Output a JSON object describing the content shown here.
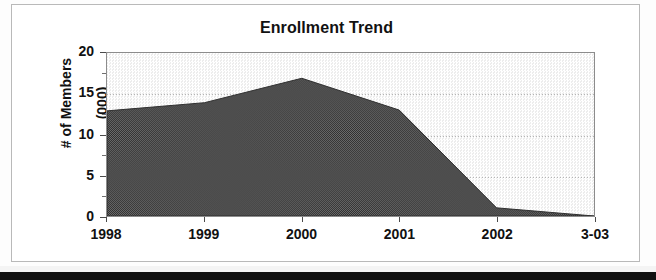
{
  "chart_data": {
    "type": "area",
    "title": "Enrollment Trend",
    "xlabel": "",
    "ylabel": "# of Members\n(000)",
    "ylabel_line1": "# of Members",
    "ylabel_line2": "(000)",
    "categories": [
      "1998",
      "1999",
      "2000",
      "2001",
      "2002",
      "3-03"
    ],
    "x": [
      "1998",
      "1999",
      "2000",
      "2001",
      "2002",
      "3-03"
    ],
    "values": [
      12.9,
      13.9,
      16.9,
      13.0,
      1.0,
      0.0
    ],
    "series": [
      {
        "name": "# of Members (000)",
        "values": [
          12.9,
          13.9,
          16.9,
          13.0,
          1.0,
          0.0
        ]
      }
    ],
    "ylim": [
      0,
      20
    ],
    "y_ticks": [
      "0",
      "5",
      "10",
      "15",
      "20"
    ],
    "y_tick_values": [
      0,
      5,
      10,
      15,
      20
    ],
    "y_minor_tick_values": [
      2.5,
      7.5,
      12.5,
      17.5
    ],
    "x_tick_labels": [
      "1998",
      "1999",
      "2000",
      "2001",
      "2002",
      "3-03"
    ],
    "grid": true,
    "legend": false,
    "legend_position": "none",
    "colors": {
      "area_fill": "#4f4f4f",
      "plot_background": "#f1f1f1",
      "gridline": "#b5b5b5",
      "axis": "#4a4a4a",
      "text": "#111111",
      "frame_border": "#b9b9b9"
    }
  }
}
